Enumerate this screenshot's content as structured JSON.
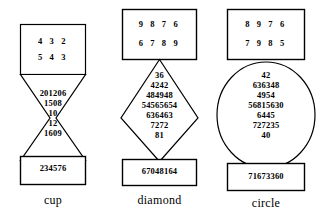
{
  "figures": [
    {
      "name": "cup",
      "caption": "cup",
      "input_rows": [
        "4  3  2",
        "5  4  3"
      ],
      "body_rows": [
        "201206",
        "1508",
        "10",
        "12",
        "1609"
      ],
      "output": "234576",
      "shape": "hourglass"
    },
    {
      "name": "diamond",
      "caption": "diamond",
      "input_rows": [
        "9  8  7  6",
        "6  7  8  9"
      ],
      "body_rows": [
        "36",
        "4242",
        "484948",
        "54565654",
        "636463",
        "7272",
        "81"
      ],
      "output": "67048164",
      "shape": "diamond"
    },
    {
      "name": "circle",
      "caption": "circle",
      "input_rows": [
        "8  9  7  6",
        "7  9  8  5"
      ],
      "body_rows": [
        "42",
        "636348",
        "4954",
        "56815630",
        "6445",
        "727235",
        "40"
      ],
      "output": "71673360",
      "shape": "circle"
    }
  ],
  "colors": {
    "stroke": "#000000",
    "fill": "#ffffff",
    "text": "#000000"
  }
}
